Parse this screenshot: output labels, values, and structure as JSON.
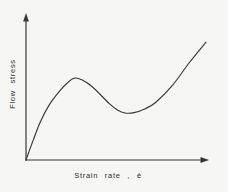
{
  "figure": {
    "background_color": "#f6f6f3",
    "line_color": "#383838",
    "text_color": "#2e2e2e"
  },
  "chart_data": {
    "type": "line",
    "title": "",
    "xlabel": "Strain rate , ė",
    "ylabel": "Flow stress",
    "axes": {
      "x_ticks": [],
      "y_ticks": [],
      "tick_labels_shown": false,
      "arrowheads": true,
      "grid": false,
      "units": "normalized 0-1 (schematic curve, no numeric scale shown)"
    },
    "legend": null,
    "features": [
      "steep initial rise from origin",
      "local maximum near x=0.27",
      "local minimum near x=0.55",
      "steep rise toward upper right"
    ],
    "series": [
      {
        "name": "flow-stress-vs-strain-rate-curve",
        "points": [
          [
            0.0,
            0.0
          ],
          [
            0.04,
            0.14
          ],
          [
            0.08,
            0.27
          ],
          [
            0.13,
            0.39
          ],
          [
            0.19,
            0.49
          ],
          [
            0.24,
            0.555
          ],
          [
            0.27,
            0.577
          ],
          [
            0.31,
            0.565
          ],
          [
            0.37,
            0.514
          ],
          [
            0.46,
            0.4
          ],
          [
            0.51,
            0.35
          ],
          [
            0.55,
            0.331
          ],
          [
            0.6,
            0.334
          ],
          [
            0.66,
            0.36
          ],
          [
            0.72,
            0.405
          ],
          [
            0.81,
            0.52
          ],
          [
            0.91,
            0.69
          ],
          [
            1.0,
            0.83
          ]
        ]
      }
    ]
  }
}
